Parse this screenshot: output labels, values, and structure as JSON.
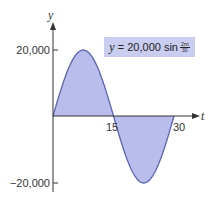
{
  "chart_data": {
    "type": "area",
    "title": "",
    "equation": {
      "lhs": "y",
      "eq": "= 20,000 sin",
      "numerator": "2πt",
      "denominator": "30"
    },
    "xlabel": "t",
    "ylabel": "y",
    "xlim": [
      0,
      30
    ],
    "ylim": [
      -20000,
      20000
    ],
    "x_ticks": [
      15,
      30
    ],
    "x_tick_labels": [
      "15",
      "30"
    ],
    "y_ticks": [
      20000,
      -20000
    ],
    "y_tick_labels": [
      "20,000",
      "−20,000"
    ],
    "grid": false,
    "function": "y = 20000*sin(2*pi*t/30)",
    "x": [
      0,
      2.5,
      5,
      7.5,
      10,
      12.5,
      15,
      17.5,
      20,
      22.5,
      25,
      27.5,
      30
    ],
    "values": [
      0,
      10000,
      17321,
      20000,
      17321,
      10000,
      0,
      -10000,
      -17321,
      -20000,
      -17321,
      -10000,
      0
    ],
    "fill_color": "#b8bdec",
    "line_color": "#5a64b4",
    "label_box_color": "#c9cdf0"
  },
  "labels": {
    "x_axis": "t",
    "y_axis": "y",
    "tick_15": "15",
    "tick_30": "30",
    "tick_pos": "20,000",
    "tick_neg": "−20,000",
    "eq_var": "y",
    "eq_rest": " = 20,000 sin",
    "eq_num": "2πt",
    "eq_den": "30"
  }
}
